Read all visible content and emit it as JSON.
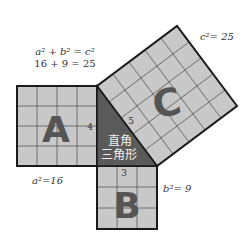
{
  "colors": {
    "square_fill": "#c8c8c8",
    "grid_line": "#555555",
    "outline": "#1a1a1a",
    "triangle_fill": "#5a5a5a",
    "letter_fill": "#555555",
    "text": "#333333",
    "triangle_text": "#f0f0f0"
  },
  "formula": {
    "line1": "a² + b² = c²",
    "line2": "16 + 9 = 25"
  },
  "squares": {
    "a": {
      "letter": "A",
      "area_label": "a²=16",
      "side_label": "4",
      "grid": 4
    },
    "b": {
      "letter": "B",
      "area_label": "b²= 9",
      "side_label": "3",
      "grid": 3
    },
    "c": {
      "letter": "C",
      "area_label": "c²= 25",
      "side_label": "5",
      "grid": 5
    }
  },
  "triangle": {
    "label_line1": "直角",
    "label_line2": "三角形"
  }
}
